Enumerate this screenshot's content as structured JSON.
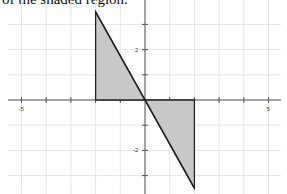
{
  "caption": "of the shaded region.",
  "chart_data": {
    "type": "area",
    "title": "",
    "xlabel": "",
    "ylabel": "",
    "xlim": [
      -5.5,
      5.5
    ],
    "ylim": [
      -3.6,
      3.6
    ],
    "grid": true,
    "x_tick_labels": [
      "-5",
      "5"
    ],
    "y_tick_labels": [
      "2",
      "-2"
    ],
    "shapes": [
      {
        "name": "upper-triangle",
        "vertices": [
          [
            -2,
            3.5
          ],
          [
            -2,
            0
          ],
          [
            0,
            0
          ]
        ],
        "fill": "#c8c8c8"
      },
      {
        "name": "lower-triangle",
        "vertices": [
          [
            0,
            0
          ],
          [
            2,
            0
          ],
          [
            2,
            -3.5
          ]
        ],
        "fill": "#c8c8c8"
      }
    ],
    "line": {
      "from": [
        -2,
        3.5
      ],
      "to": [
        2,
        -3.5
      ]
    }
  },
  "colors": {
    "grid": "#e6e6e6",
    "axis": "#555555",
    "shape_fill": "#c8c8c8",
    "shape_stroke": "#222222"
  }
}
